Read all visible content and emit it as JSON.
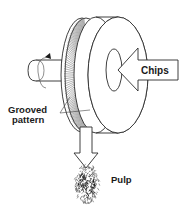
{
  "diagram": {
    "labels": {
      "chips": "Chips",
      "grooved_line1": "Grooved",
      "grooved_line2": "pattern",
      "pulp": "Pulp"
    },
    "components": [
      "drive-shaft",
      "rotation-arrow",
      "rotating-grooved-disc",
      "stationary-disc",
      "chips-inlet-arrow",
      "pulp-outlet-arrow",
      "pulp-fibers"
    ],
    "colors": {
      "line": "#2a2a2a",
      "background": "#ffffff",
      "text": "#1a1a1a"
    }
  }
}
